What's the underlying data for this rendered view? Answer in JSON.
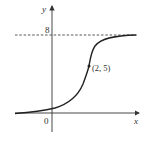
{
  "figure": {
    "type": "function-graph",
    "axes": {
      "x_label": "x",
      "y_label": "y",
      "origin_label": "0"
    },
    "asymptote": {
      "label": "8",
      "style": "dashed",
      "value": 8
    },
    "point": {
      "label": "(2, 5)",
      "x": 2,
      "y": 5
    },
    "colors": {
      "curve": "#222222",
      "axes": "#333333",
      "background": "#ffffff"
    }
  }
}
